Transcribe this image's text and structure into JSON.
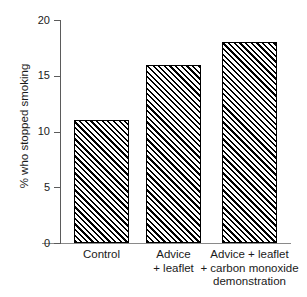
{
  "top_clipped_text": "· ·   ·   · ·   ·     ·     ·",
  "chart_data": {
    "type": "bar",
    "title": "",
    "xlabel": "",
    "ylabel": "% who stopped smoking",
    "categories": [
      "Control",
      "Advice\n+ leaflet",
      "Advice + leaflet\n+ carbon monoxide\ndemonstration"
    ],
    "category_lines": [
      [
        "Control"
      ],
      [
        "Advice",
        "+ leaflet"
      ],
      [
        "Advice + leaflet",
        "+ carbon monoxide",
        "demonstration"
      ]
    ],
    "values": [
      11,
      16,
      18
    ],
    "ylim": [
      0,
      20
    ],
    "yticks": [
      0,
      5,
      10,
      15,
      20
    ],
    "ytick_labels": [
      "0",
      "5",
      "10",
      "15",
      "20"
    ],
    "grid": false,
    "legend": false,
    "bar_fill": "diagonal-hatch",
    "bar_edge_color": "#000000",
    "bar_face_color": "#ffffff",
    "axis_color": "#5b5b5b"
  }
}
